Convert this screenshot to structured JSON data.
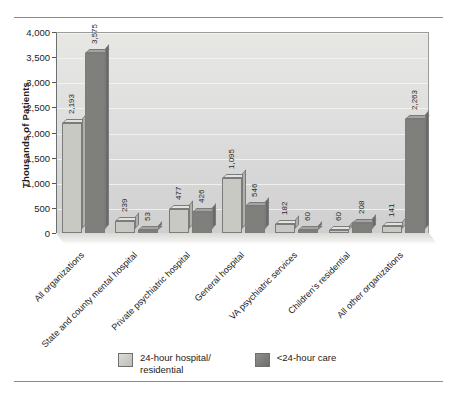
{
  "chart_data": {
    "type": "bar",
    "title": "",
    "xlabel": "",
    "ylabel": "Thousands of Patients",
    "ylim": [
      0,
      4000
    ],
    "ytick_labels": [
      "4,000",
      "3,500",
      "3,000",
      "2,500",
      "2,000",
      "1,500",
      "1,000",
      "500",
      "0"
    ],
    "ytick_values": [
      4000,
      3500,
      3000,
      2500,
      2000,
      1500,
      1000,
      500,
      0
    ],
    "grid": true,
    "legend_position": "bottom",
    "categories": [
      "All organizations",
      "State and county mental hospital",
      "Private psychiatric hospital",
      "General hospital",
      "VA psychiatric services",
      "Children's residential",
      "All other organizations"
    ],
    "series": [
      {
        "name": "24-hour hospital/ residential",
        "color": "#c9c9c4",
        "values": [
          2193,
          239,
          477,
          1095,
          182,
          60,
          141
        ],
        "labels": [
          "2,193",
          "239",
          "477",
          "1,095",
          "182",
          "60",
          "141"
        ]
      },
      {
        "name": "<24-hour care",
        "color": "#7f7f7c",
        "values": [
          3575,
          53,
          426,
          546,
          60,
          208,
          2263
        ],
        "labels": [
          "3,575",
          "53",
          "426",
          "546",
          "60",
          "208",
          "2,263"
        ]
      }
    ]
  },
  "legend": {
    "items": [
      {
        "label_line1": "24-hour hospital/",
        "label_line2": "residential",
        "swatch": "light"
      },
      {
        "label_line1": "<24-hour care",
        "label_line2": "",
        "swatch": "dark"
      }
    ]
  }
}
